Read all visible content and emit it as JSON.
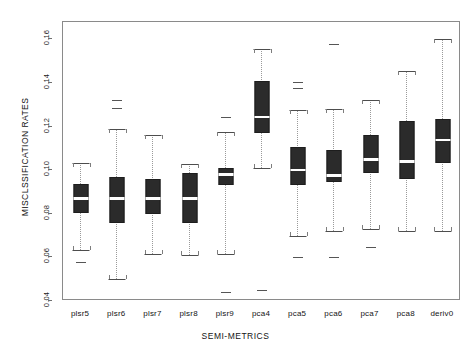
{
  "chart_data": {
    "type": "boxplot",
    "title": "",
    "xlabel": "SEMI-METRICS",
    "ylabel": "MISCLSSIFICATION RATES",
    "ylim": [
      0.04,
      0.168
    ],
    "yticks": [
      0.04,
      0.06,
      0.08,
      0.1,
      0.12,
      0.14,
      0.16
    ],
    "ytick_labels": [
      "0.04",
      "0.06",
      "0.08",
      "0.10",
      "0.12",
      "0.14",
      "0.16"
    ],
    "grid": false,
    "legend": "none",
    "categories": [
      "plsr5",
      "plsr6",
      "plsr7",
      "plsr8",
      "plsr9",
      "pca4",
      "pca5",
      "pca6",
      "pca7",
      "pca8",
      "deriv0"
    ],
    "boxes": [
      {
        "label": "plsr5",
        "whisker_low": 0.0635,
        "q1": 0.0805,
        "median": 0.087,
        "q3": 0.0935,
        "whisker_high": 0.1035,
        "outliers": [
          0.058
        ]
      },
      {
        "label": "plsr6",
        "whisker_low": 0.05,
        "q1": 0.076,
        "median": 0.087,
        "q3": 0.097,
        "whisker_high": 0.119,
        "outliers": [
          0.1285,
          0.132
        ]
      },
      {
        "label": "plsr7",
        "whisker_low": 0.0615,
        "q1": 0.08,
        "median": 0.087,
        "q3": 0.096,
        "whisker_high": 0.116,
        "outliers": []
      },
      {
        "label": "plsr8",
        "whisker_low": 0.061,
        "q1": 0.076,
        "median": 0.087,
        "q3": 0.0985,
        "whisker_high": 0.103,
        "outliers": []
      },
      {
        "label": "plsr9",
        "whisker_low": 0.0615,
        "q1": 0.093,
        "median": 0.098,
        "q3": 0.101,
        "whisker_high": 0.1175,
        "outliers": [
          0.1245,
          0.044
        ]
      },
      {
        "label": "pca4",
        "whisker_low": 0.101,
        "q1": 0.117,
        "median": 0.1245,
        "q3": 0.141,
        "whisker_high": 0.1555,
        "outliers": [
          0.045
        ]
      },
      {
        "label": "pca5",
        "whisker_low": 0.07,
        "q1": 0.093,
        "median": 0.1,
        "q3": 0.1105,
        "whisker_high": 0.1275,
        "outliers": [
          0.1375,
          0.1405,
          0.06
        ]
      },
      {
        "label": "pca6",
        "whisker_low": 0.072,
        "q1": 0.0945,
        "median": 0.0975,
        "q3": 0.1095,
        "whisker_high": 0.128,
        "outliers": [
          0.158,
          0.06
        ]
      },
      {
        "label": "pca7",
        "whisker_low": 0.073,
        "q1": 0.0985,
        "median": 0.105,
        "q3": 0.116,
        "whisker_high": 0.132,
        "outliers": [
          0.065
        ]
      },
      {
        "label": "pca8",
        "whisker_low": 0.072,
        "q1": 0.096,
        "median": 0.104,
        "q3": 0.1225,
        "whisker_high": 0.1455,
        "outliers": []
      },
      {
        "label": "deriv0",
        "whisker_low": 0.072,
        "q1": 0.1035,
        "median": 0.114,
        "q3": 0.1235,
        "whisker_high": 0.16,
        "outliers": []
      }
    ]
  },
  "style": {
    "box_fill": "#2b2b2b",
    "median_color": "#ffffff",
    "whisker_color": "#9a9a9a",
    "frame_color": "#8a8a8a",
    "background": "#ffffff"
  }
}
